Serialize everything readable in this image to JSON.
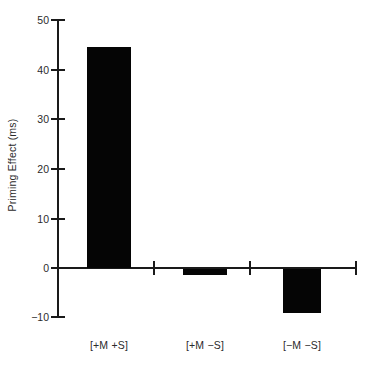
{
  "chart_data": {
    "type": "bar",
    "title": "",
    "xlabel": "",
    "ylabel": "Priming Effect (ms)",
    "categories": [
      "[+M +S]",
      "[+M −S]",
      "[−M −S]"
    ],
    "values": [
      44.3,
      -1.2,
      -8.8
    ],
    "ylim": [
      -10,
      50
    ],
    "yticks": [
      50,
      40,
      30,
      20,
      10,
      0,
      -10
    ],
    "ytick_labels": [
      "50",
      "40",
      "30",
      "20",
      "10",
      "0",
      "−10"
    ],
    "grid": false,
    "legend": null,
    "bar_color": "#050505",
    "axis_color": "#1a1a1a",
    "background": "#ffffff"
  }
}
